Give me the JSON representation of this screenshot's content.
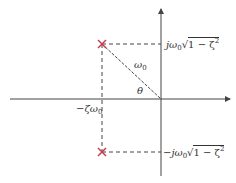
{
  "diagram": {
    "colors": {
      "axis": "#444444",
      "pole": "#c8394a",
      "dashed": "#444444",
      "text": "#333333"
    },
    "labels": {
      "top_pole": {
        "prefix": "jω",
        "sub": "0",
        "radical": "1 − ζ",
        "sup": "2"
      },
      "bottom_pole": {
        "prefix": "−jω",
        "sub": "0",
        "radical": "1 − ζ",
        "sup": "2"
      },
      "real_part": {
        "prefix": "−ζω",
        "sub": "0"
      },
      "magnitude": {
        "prefix": "ω",
        "sub": "0"
      },
      "angle": "θ"
    },
    "elements": {
      "poles": [
        {
          "name": "upper-pole",
          "x": 102,
          "y": 44,
          "marker": "×"
        },
        {
          "name": "lower-pole",
          "x": 102,
          "y": 152,
          "marker": "×"
        }
      ],
      "origin": {
        "x": 161,
        "y": 99
      }
    }
  }
}
